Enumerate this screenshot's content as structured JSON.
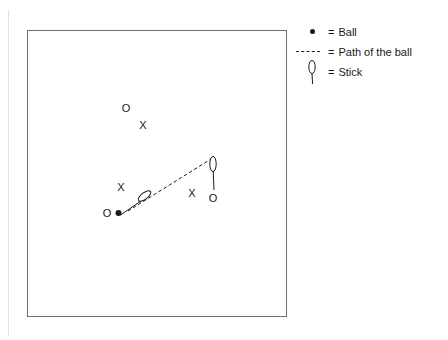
{
  "diagram": {
    "field": {
      "shape": "rectangle",
      "x": 27,
      "y": 30,
      "width": 260,
      "height": 287,
      "border_color": "#6e6e6e",
      "fill_color": "#ffffff"
    },
    "markers": [
      {
        "type": "offense",
        "label": "O",
        "x": 126,
        "y": 108,
        "name": "offense-marker-upper"
      },
      {
        "type": "defense",
        "label": "X",
        "x": 143,
        "y": 125,
        "name": "defense-marker-upper"
      },
      {
        "type": "defense",
        "label": "X",
        "x": 121,
        "y": 187,
        "name": "defense-marker-left"
      },
      {
        "type": "offense",
        "label": "O",
        "x": 107,
        "y": 213,
        "name": "offense-marker-left"
      },
      {
        "type": "defense",
        "label": "X",
        "x": 192,
        "y": 193,
        "name": "defense-marker-right"
      },
      {
        "type": "offense",
        "label": "O",
        "x": 213,
        "y": 198,
        "name": "offense-marker-right"
      }
    ],
    "ball": {
      "x": 118,
      "y": 213,
      "radius": 3,
      "color": "#1a1a1a",
      "name": "ball"
    },
    "path": {
      "from_x": 128,
      "from_y": 211,
      "to_x": 211,
      "to_y": 159,
      "style": "dashed",
      "color": "#1a1a1a",
      "name": "ball-path"
    },
    "sticks": [
      {
        "name": "stick-left",
        "orientation": "diagonal",
        "blade_cx": 144,
        "blade_cy": 196,
        "blade_rx": 3.2,
        "blade_ry": 7.5,
        "blade_rotation": 52,
        "shaft_x1": 141,
        "shaft_y1": 201,
        "shaft_x2": 120,
        "shaft_y2": 215
      },
      {
        "name": "stick-right",
        "orientation": "vertical",
        "blade_cx": 213,
        "blade_cy": 164,
        "blade_rx": 3.2,
        "blade_ry": 7.5,
        "blade_rotation": 0,
        "shaft_x1": 213,
        "shaft_y1": 171,
        "shaft_x2": 214,
        "shaft_y2": 190
      }
    ]
  },
  "legend": {
    "title": "Legend",
    "entries": [
      {
        "marker": "ball-dot-icon",
        "equals": "=",
        "label": "Ball"
      },
      {
        "marker": "dashed-line-icon",
        "equals": "=",
        "label": "Path of the ball"
      },
      {
        "marker": "stick-icon",
        "equals": "=",
        "label": "Stick"
      }
    ]
  },
  "colors": {
    "ink": "#1a1a1a",
    "field_border": "#6e6e6e",
    "background": "#ffffff",
    "page_rule": "#e2e2e2"
  }
}
